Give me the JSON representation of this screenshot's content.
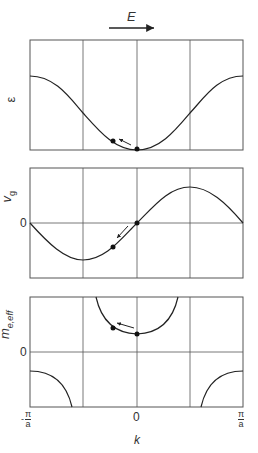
{
  "field_label": "E",
  "panels": [
    {
      "id": "energy",
      "ylabel": "ε",
      "zero_label": ""
    },
    {
      "id": "group-velocity",
      "ylabel": "v",
      "ylabel_sub": "g",
      "zero_label": "0"
    },
    {
      "id": "effective-mass",
      "ylabel": "m",
      "ylabel_sub": "e,eff",
      "zero_label": "0"
    }
  ],
  "xaxis": {
    "label": "k",
    "ticks": [
      {
        "num": "π",
        "den": "a",
        "sign": "-"
      },
      {
        "text": "0"
      },
      {
        "num": "π",
        "den": "a",
        "sign": ""
      }
    ]
  },
  "colors": {
    "line": "#222222",
    "grid": "#555555"
  }
}
